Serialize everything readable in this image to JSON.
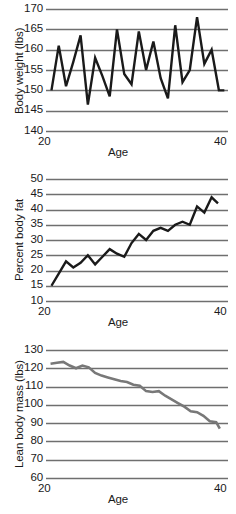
{
  "figure": {
    "background_color": "#ffffff",
    "grid_color": "#6f6f6f",
    "text_color": "#1a1a1a",
    "panel_count": 3
  },
  "chart_data": [
    {
      "type": "line",
      "title": "",
      "xlabel": "Age",
      "ylabel": "Body weight (lbs)",
      "xlim": [
        20,
        40
      ],
      "ylim": [
        140,
        170
      ],
      "xticks": [
        20,
        40
      ],
      "yticks": [
        140,
        145,
        150,
        155,
        160,
        165,
        170
      ],
      "grid": true,
      "legend": "none",
      "line_color": "#1a1a1a",
      "line_width": 2.4,
      "x": [
        20.6,
        21.4,
        22.2,
        23.0,
        23.8,
        24.6,
        25.4,
        26.2,
        27.0,
        27.8,
        28.6,
        29.4,
        30.2,
        31.0,
        31.8,
        32.6,
        33.4,
        34.2,
        35.0,
        35.8,
        36.6,
        37.4,
        38.2,
        39.0,
        39.6
      ],
      "y": [
        150.0,
        161.0,
        151.0,
        157.0,
        163.5,
        146.5,
        158.0,
        153.5,
        148.5,
        165.0,
        154.0,
        151.5,
        164.5,
        155.0,
        162.0,
        153.0,
        148.0,
        166.0,
        152.0,
        155.0,
        168.0,
        156.5,
        160.0,
        150.0,
        150.0
      ]
    },
    {
      "type": "line",
      "title": "",
      "xlabel": "Age",
      "ylabel": "Percent body fat",
      "xlim": [
        20,
        40
      ],
      "ylim": [
        10,
        50
      ],
      "xticks": [
        20,
        40
      ],
      "yticks": [
        10,
        15,
        20,
        25,
        30,
        35,
        40,
        45,
        50
      ],
      "grid": true,
      "legend": "none",
      "line_color": "#1a1a1a",
      "line_width": 2.4,
      "x": [
        20.6,
        21.4,
        22.2,
        23.0,
        23.8,
        24.6,
        25.4,
        26.2,
        27.0,
        27.8,
        28.6,
        29.4,
        30.2,
        31.0,
        31.8,
        32.6,
        33.4,
        34.2,
        35.0,
        35.8,
        36.6,
        37.4,
        38.2,
        38.9
      ],
      "y": [
        15.0,
        19.0,
        23.0,
        21.0,
        22.5,
        25.0,
        22.0,
        24.5,
        27.0,
        25.5,
        24.5,
        29.0,
        32.0,
        30.0,
        33.0,
        34.0,
        33.0,
        35.0,
        36.0,
        35.0,
        41.0,
        39.0,
        44.0,
        42.0
      ]
    },
    {
      "type": "line",
      "title": "",
      "xlabel": "Age",
      "ylabel": "Lean body mass (lbs)",
      "xlim": [
        20,
        40
      ],
      "ylim": [
        60,
        130
      ],
      "xticks": [
        20,
        40
      ],
      "yticks": [
        60,
        70,
        80,
        90,
        100,
        110,
        120,
        130
      ],
      "grid": true,
      "legend": "none",
      "line_color": "#787878",
      "line_width": 2.6,
      "x": [
        20.5,
        21.2,
        21.9,
        22.6,
        23.3,
        24.0,
        24.7,
        25.4,
        26.1,
        26.8,
        27.5,
        28.2,
        28.9,
        29.6,
        30.3,
        31.0,
        31.7,
        32.4,
        33.1,
        33.8,
        34.5,
        35.2,
        35.9,
        36.6,
        37.3,
        38.0,
        38.7,
        39.1
      ],
      "y": [
        122.5,
        123.0,
        123.5,
        121.5,
        120.0,
        121.5,
        120.5,
        117.5,
        116.0,
        115.0,
        114.0,
        113.0,
        112.5,
        111.0,
        110.5,
        107.5,
        107.0,
        107.5,
        105.0,
        103.0,
        101.0,
        99.0,
        96.5,
        96.0,
        94.0,
        91.0,
        90.5,
        87.0
      ]
    }
  ]
}
